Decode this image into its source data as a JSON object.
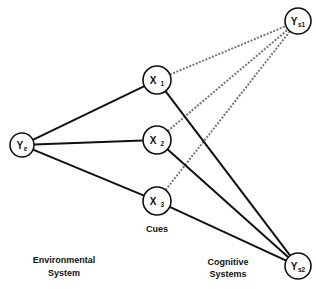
{
  "diagram": {
    "type": "lens-model",
    "nodes": [
      {
        "id": "Ye",
        "main": "Y",
        "sub": "e",
        "cx": 22,
        "cy": 145,
        "r": 12
      },
      {
        "id": "X1",
        "main": "X",
        "sub": "1",
        "cx": 157,
        "cy": 80,
        "r": 14
      },
      {
        "id": "X2",
        "main": "X",
        "sub": "2",
        "cx": 157,
        "cy": 140,
        "r": 14
      },
      {
        "id": "X3",
        "main": "X",
        "sub": "3",
        "cx": 157,
        "cy": 201,
        "r": 14
      },
      {
        "id": "Ys1",
        "main": "Y",
        "sub": "s1",
        "cx": 298,
        "cy": 21,
        "r": 13
      },
      {
        "id": "Ys2",
        "main": "Y",
        "sub": "s2",
        "cx": 298,
        "cy": 266,
        "r": 13
      }
    ],
    "edges": [
      {
        "from": "Ye",
        "to": "X1",
        "style": "solid"
      },
      {
        "from": "Ye",
        "to": "X2",
        "style": "solid"
      },
      {
        "from": "Ye",
        "to": "X3",
        "style": "solid"
      },
      {
        "from": "X1",
        "to": "Ys1",
        "style": "dashed"
      },
      {
        "from": "X2",
        "to": "Ys1",
        "style": "dashed"
      },
      {
        "from": "X3",
        "to": "Ys1",
        "style": "dashed"
      },
      {
        "from": "X1",
        "to": "Ys2",
        "style": "solid"
      },
      {
        "from": "X2",
        "to": "Ys2",
        "style": "solid"
      },
      {
        "from": "X3",
        "to": "Ys2",
        "style": "solid"
      }
    ],
    "labels": {
      "cues": "Cues",
      "environmental_line1": "Environmental",
      "environmental_line2": "System",
      "cognitive_line1": "Cognitive",
      "cognitive_line2": "Systems"
    }
  }
}
